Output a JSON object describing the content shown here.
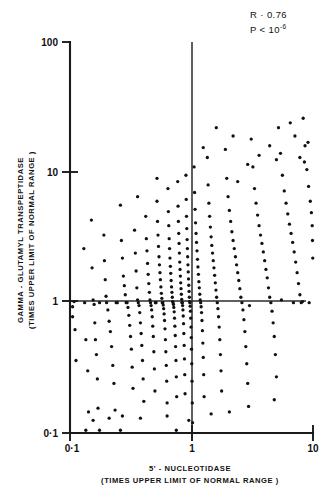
{
  "chart_data": {
    "type": "scatter",
    "title": "",
    "xlabel": "5' - NUCLEOTIDASE",
    "xlabel_sub": "(TIMES UPPER LIMIT OF NORMAL RANGE )",
    "ylabel": "GAMMA - GLUTAMYL  TRANSPEPTIDASE",
    "ylabel_sub": "(TIMES UPPER LIMIT OF NORMAL RANGE )",
    "xscale": "log",
    "yscale": "log",
    "xlim": [
      0.1,
      10
    ],
    "ylim": [
      0.1,
      100
    ],
    "xticks": [
      0.1,
      1,
      10
    ],
    "xticklabels": [
      "0·1",
      "1",
      "10"
    ],
    "yticks": [
      0.1,
      1,
      10,
      100
    ],
    "yticklabels": [
      "0·1",
      "1",
      "10",
      "100"
    ],
    "grid": false,
    "legend": null,
    "reference_lines": [
      {
        "orient": "horizontal",
        "value": 1,
        "label": "upper limit of normal GGT"
      },
      {
        "orient": "vertical",
        "value": 1,
        "label": "upper limit of normal 5'-nucleotidase"
      }
    ],
    "annotations": [
      {
        "text": "R · 0.76",
        "x": 0.78,
        "y": 0.97
      },
      {
        "text": "P < 10",
        "sup": "-6",
        "x": 0.78,
        "y": 0.92
      }
    ],
    "stats": {
      "r": 0.76,
      "p_text": "P < 10^-6"
    },
    "n_points": 302,
    "points": [
      [
        0.105,
        0.93
      ],
      [
        0.105,
        0.78
      ],
      [
        0.108,
        1.02
      ],
      [
        0.11,
        0.62
      ],
      [
        0.112,
        0.36
      ],
      [
        0.13,
        2.6
      ],
      [
        0.132,
        1.0
      ],
      [
        0.135,
        0.52
      ],
      [
        0.14,
        0.3
      ],
      [
        0.142,
        0.145
      ],
      [
        0.15,
        4.3
      ],
      [
        0.152,
        1.85
      ],
      [
        0.155,
        1.05
      ],
      [
        0.158,
        0.97
      ],
      [
        0.16,
        0.7
      ],
      [
        0.162,
        0.52
      ],
      [
        0.165,
        0.4
      ],
      [
        0.168,
        0.26
      ],
      [
        0.17,
        0.155
      ],
      [
        0.175,
        1.0
      ],
      [
        0.19,
        3.3
      ],
      [
        0.192,
        2.1
      ],
      [
        0.195,
        1.5
      ],
      [
        0.198,
        1.12
      ],
      [
        0.2,
        1.0
      ],
      [
        0.205,
        0.88
      ],
      [
        0.21,
        0.72
      ],
      [
        0.215,
        0.6
      ],
      [
        0.22,
        0.46
      ],
      [
        0.225,
        0.33
      ],
      [
        0.23,
        0.24
      ],
      [
        0.235,
        0.15
      ],
      [
        0.24,
        1.0
      ],
      [
        0.245,
        1.0
      ],
      [
        0.26,
        5.6
      ],
      [
        0.265,
        3.0
      ],
      [
        0.27,
        2.2
      ],
      [
        0.275,
        1.6
      ],
      [
        0.28,
        1.35
      ],
      [
        0.285,
        1.15
      ],
      [
        0.29,
        1.0
      ],
      [
        0.295,
        1.0
      ],
      [
        0.3,
        0.92
      ],
      [
        0.305,
        0.8
      ],
      [
        0.31,
        0.67
      ],
      [
        0.315,
        0.55
      ],
      [
        0.32,
        0.44
      ],
      [
        0.325,
        0.32
      ],
      [
        0.33,
        0.22
      ],
      [
        0.34,
        3.6
      ],
      [
        0.345,
        2.4
      ],
      [
        0.35,
        1.75
      ],
      [
        0.355,
        1.3
      ],
      [
        0.36,
        1.05
      ],
      [
        0.365,
        1.0
      ],
      [
        0.37,
        0.95
      ],
      [
        0.375,
        0.84
      ],
      [
        0.38,
        0.7
      ],
      [
        0.385,
        0.58
      ],
      [
        0.39,
        0.47
      ],
      [
        0.395,
        0.36
      ],
      [
        0.4,
        0.26
      ],
      [
        0.405,
        0.175
      ],
      [
        0.42,
        4.6
      ],
      [
        0.425,
        3.1
      ],
      [
        0.43,
        2.5
      ],
      [
        0.435,
        2.0
      ],
      [
        0.44,
        1.65
      ],
      [
        0.445,
        1.4
      ],
      [
        0.45,
        1.2
      ],
      [
        0.455,
        1.05
      ],
      [
        0.46,
        1.0
      ],
      [
        0.465,
        0.95
      ],
      [
        0.47,
        0.88
      ],
      [
        0.475,
        0.78
      ],
      [
        0.48,
        0.66
      ],
      [
        0.485,
        0.55
      ],
      [
        0.49,
        0.42
      ],
      [
        0.495,
        0.31
      ],
      [
        0.5,
        0.21
      ],
      [
        0.505,
        1.0
      ],
      [
        0.51,
        1.0
      ],
      [
        0.52,
        6.0
      ],
      [
        0.525,
        4.2
      ],
      [
        0.53,
        3.3
      ],
      [
        0.535,
        2.7
      ],
      [
        0.54,
        2.25
      ],
      [
        0.545,
        1.95
      ],
      [
        0.55,
        1.7
      ],
      [
        0.555,
        1.5
      ],
      [
        0.56,
        1.32
      ],
      [
        0.565,
        1.18
      ],
      [
        0.57,
        1.08
      ],
      [
        0.575,
        1.0
      ],
      [
        0.58,
        1.0
      ],
      [
        0.585,
        0.96
      ],
      [
        0.59,
        0.9
      ],
      [
        0.595,
        0.82
      ],
      [
        0.6,
        0.73
      ],
      [
        0.605,
        0.63
      ],
      [
        0.61,
        0.52
      ],
      [
        0.615,
        0.42
      ],
      [
        0.62,
        0.33
      ],
      [
        0.625,
        0.25
      ],
      [
        0.63,
        0.17
      ],
      [
        0.64,
        7.5
      ],
      [
        0.645,
        5.0
      ],
      [
        0.65,
        3.9
      ],
      [
        0.655,
        3.1
      ],
      [
        0.66,
        2.6
      ],
      [
        0.665,
        2.2
      ],
      [
        0.67,
        1.9
      ],
      [
        0.675,
        1.68
      ],
      [
        0.68,
        1.48
      ],
      [
        0.685,
        1.32
      ],
      [
        0.69,
        1.2
      ],
      [
        0.695,
        1.1
      ],
      [
        0.7,
        1.02
      ],
      [
        0.705,
        1.0
      ],
      [
        0.71,
        0.97
      ],
      [
        0.715,
        0.92
      ],
      [
        0.72,
        0.85
      ],
      [
        0.725,
        0.76
      ],
      [
        0.73,
        0.66
      ],
      [
        0.735,
        0.56
      ],
      [
        0.74,
        0.46
      ],
      [
        0.745,
        0.36
      ],
      [
        0.75,
        0.27
      ],
      [
        0.755,
        0.19
      ],
      [
        0.77,
        8.5
      ],
      [
        0.775,
        5.5
      ],
      [
        0.78,
        4.2
      ],
      [
        0.785,
        3.4
      ],
      [
        0.79,
        2.85
      ],
      [
        0.795,
        2.4
      ],
      [
        0.8,
        2.05
      ],
      [
        0.805,
        1.8
      ],
      [
        0.81,
        1.6
      ],
      [
        0.815,
        1.42
      ],
      [
        0.82,
        1.28
      ],
      [
        0.825,
        1.16
      ],
      [
        0.83,
        1.06
      ],
      [
        0.835,
        1.0
      ],
      [
        0.84,
        1.0
      ],
      [
        0.845,
        0.95
      ],
      [
        0.85,
        0.88
      ],
      [
        0.855,
        0.79
      ],
      [
        0.86,
        0.69
      ],
      [
        0.865,
        0.58
      ],
      [
        0.87,
        0.47
      ],
      [
        0.875,
        0.37
      ],
      [
        0.88,
        0.28
      ],
      [
        0.885,
        0.2
      ],
      [
        0.9,
        9.5
      ],
      [
        0.905,
        6.2
      ],
      [
        0.91,
        4.6
      ],
      [
        0.915,
        3.7
      ],
      [
        0.92,
        3.05
      ],
      [
        0.925,
        2.6
      ],
      [
        0.93,
        2.25
      ],
      [
        0.935,
        1.95
      ],
      [
        0.94,
        1.72
      ],
      [
        0.945,
        1.52
      ],
      [
        0.95,
        1.36
      ],
      [
        0.955,
        1.22
      ],
      [
        0.96,
        1.1
      ],
      [
        0.965,
        1.02
      ],
      [
        0.97,
        1.0
      ],
      [
        0.975,
        0.94
      ],
      [
        0.98,
        0.86
      ],
      [
        0.985,
        0.76
      ],
      [
        0.99,
        0.65
      ],
      [
        0.995,
        0.54
      ],
      [
        1.0,
        0.44
      ],
      [
        1.005,
        0.34
      ],
      [
        1.01,
        0.25
      ],
      [
        1.015,
        0.17
      ],
      [
        1.02,
        0.12
      ],
      [
        1.05,
        11.0
      ],
      [
        1.06,
        7.0
      ],
      [
        1.07,
        5.2
      ],
      [
        1.08,
        4.1
      ],
      [
        1.09,
        3.4
      ],
      [
        1.1,
        2.9
      ],
      [
        1.11,
        2.5
      ],
      [
        1.12,
        2.15
      ],
      [
        1.13,
        1.88
      ],
      [
        1.14,
        1.65
      ],
      [
        1.15,
        1.45
      ],
      [
        1.16,
        1.3
      ],
      [
        1.17,
        1.16
      ],
      [
        1.18,
        1.05
      ],
      [
        1.19,
        1.0
      ],
      [
        1.2,
        0.93
      ],
      [
        1.21,
        0.84
      ],
      [
        1.22,
        0.73
      ],
      [
        1.23,
        0.61
      ],
      [
        1.24,
        0.49
      ],
      [
        1.25,
        0.38
      ],
      [
        1.26,
        0.28
      ],
      [
        1.27,
        0.19
      ],
      [
        1.35,
        13.0
      ],
      [
        1.37,
        8.0
      ],
      [
        1.39,
        5.8
      ],
      [
        1.41,
        4.6
      ],
      [
        1.43,
        3.8
      ],
      [
        1.45,
        3.2
      ],
      [
        1.47,
        2.75
      ],
      [
        1.49,
        2.4
      ],
      [
        1.51,
        2.1
      ],
      [
        1.53,
        1.85
      ],
      [
        1.55,
        1.62
      ],
      [
        1.57,
        1.42
      ],
      [
        1.59,
        1.25
      ],
      [
        1.61,
        1.1
      ],
      [
        1.63,
        1.0
      ],
      [
        1.65,
        0.9
      ],
      [
        1.67,
        0.78
      ],
      [
        1.69,
        0.65
      ],
      [
        1.71,
        0.52
      ],
      [
        1.73,
        0.4
      ],
      [
        1.75,
        0.3
      ],
      [
        1.77,
        0.21
      ],
      [
        1.9,
        15.0
      ],
      [
        1.95,
        9.0
      ],
      [
        2.0,
        6.5
      ],
      [
        2.05,
        5.1
      ],
      [
        2.1,
        4.2
      ],
      [
        2.15,
        3.5
      ],
      [
        2.2,
        3.0
      ],
      [
        2.25,
        2.6
      ],
      [
        2.3,
        2.25
      ],
      [
        2.35,
        1.95
      ],
      [
        2.4,
        1.7
      ],
      [
        2.45,
        1.48
      ],
      [
        2.5,
        1.28
      ],
      [
        2.55,
        1.1
      ],
      [
        2.6,
        1.0
      ],
      [
        2.65,
        0.88
      ],
      [
        2.7,
        0.74
      ],
      [
        2.75,
        0.6
      ],
      [
        2.8,
        0.46
      ],
      [
        2.85,
        0.34
      ],
      [
        2.9,
        0.24
      ],
      [
        2.95,
        0.16
      ],
      [
        3.1,
        18.0
      ],
      [
        3.2,
        11.0
      ],
      [
        3.3,
        7.5
      ],
      [
        3.4,
        5.8
      ],
      [
        3.5,
        4.7
      ],
      [
        3.6,
        3.9
      ],
      [
        3.7,
        3.3
      ],
      [
        3.8,
        2.85
      ],
      [
        3.9,
        2.45
      ],
      [
        4.0,
        2.1
      ],
      [
        4.1,
        1.8
      ],
      [
        4.2,
        1.55
      ],
      [
        4.3,
        1.3
      ],
      [
        4.4,
        1.1
      ],
      [
        4.5,
        1.0
      ],
      [
        4.6,
        0.86
      ],
      [
        4.7,
        0.7
      ],
      [
        4.8,
        0.55
      ],
      [
        4.9,
        0.4
      ],
      [
        5.0,
        0.27
      ],
      [
        5.2,
        22.0
      ],
      [
        5.4,
        14.0
      ],
      [
        5.6,
        9.5
      ],
      [
        5.8,
        7.2
      ],
      [
        6.0,
        5.8
      ],
      [
        6.2,
        4.8
      ],
      [
        6.4,
        4.0
      ],
      [
        6.6,
        3.4
      ],
      [
        6.8,
        2.9
      ],
      [
        7.0,
        2.45
      ],
      [
        7.2,
        2.05
      ],
      [
        7.4,
        1.7
      ],
      [
        7.6,
        1.4
      ],
      [
        7.8,
        1.15
      ],
      [
        8.0,
        1.0
      ],
      [
        8.3,
        26.0
      ],
      [
        8.6,
        16.0
      ],
      [
        8.9,
        10.5
      ],
      [
        9.2,
        7.8
      ],
      [
        9.5,
        6.0
      ],
      [
        9.7,
        4.9
      ],
      [
        9.85,
        3.9
      ],
      [
        9.9,
        3.0
      ],
      [
        9.95,
        2.2
      ],
      [
        6.5,
        24.0
      ],
      [
        7.1,
        19.0
      ],
      [
        7.8,
        13.0
      ],
      [
        8.5,
        12.0
      ],
      [
        9.1,
        17.0
      ],
      [
        4.4,
        16.0
      ],
      [
        5.0,
        12.5
      ],
      [
        3.6,
        13.5
      ],
      [
        2.9,
        11.5
      ],
      [
        2.4,
        8.5
      ],
      [
        5.5,
        1.05
      ],
      [
        6.9,
        1.0
      ],
      [
        8.2,
        1.02
      ],
      [
        9.3,
        1.0
      ],
      [
        3.0,
        0.95
      ],
      [
        4.8,
        0.18
      ],
      [
        2.05,
        0.145
      ],
      [
        1.45,
        0.14
      ],
      [
        0.95,
        0.125
      ],
      [
        0.63,
        0.135
      ],
      [
        0.38,
        0.13
      ],
      [
        0.27,
        0.135
      ],
      [
        0.21,
        0.13
      ],
      [
        0.155,
        0.125
      ],
      [
        0.135,
        0.105
      ],
      [
        0.175,
        0.105
      ],
      [
        0.26,
        0.105
      ],
      [
        0.75,
        0.105
      ],
      [
        1.6,
        22.0
      ],
      [
        2.2,
        19.0
      ],
      [
        1.25,
        15.5
      ],
      [
        0.52,
        9.0
      ],
      [
        0.36,
        6.5
      ]
    ]
  },
  "figure": {
    "background_color": "#ffffff",
    "ink_color": "#111111"
  }
}
